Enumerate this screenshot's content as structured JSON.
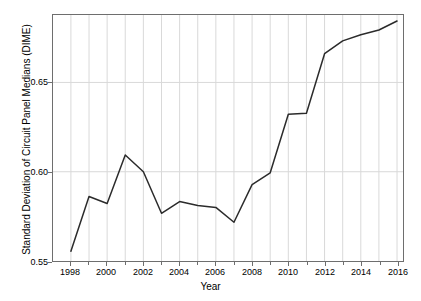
{
  "chart_data": {
    "type": "line",
    "title": "",
    "xlabel": "Year",
    "ylabel": "Standard Deviation of Circuit Panel Medians (DIME)",
    "xlim": [
      1997.0,
      1997.0
    ],
    "ylim": [
      0.55,
      0.6878
    ],
    "xlim_values": [
      1997.0,
      2017.0
    ],
    "grid": true,
    "legend": "none",
    "x": [
      1998,
      1999,
      2000,
      2001,
      2002,
      2003,
      2004,
      2005,
      2006,
      2007,
      2008,
      2009,
      2010,
      2011,
      2012,
      2013,
      2014,
      2015,
      2016
    ],
    "values": [
      0.5555,
      0.5861,
      0.5822,
      0.6094,
      0.6,
      0.5767,
      0.5833,
      0.5811,
      0.58,
      0.5717,
      0.5928,
      0.5994,
      0.6322,
      0.6328,
      0.6661,
      0.6733,
      0.6767,
      0.6794,
      0.6844
    ],
    "series": [
      {
        "name": "Standard Deviation of Circuit Panel Medians (DIME)",
        "color": "#2b2b2b",
        "values": [
          0.5555,
          0.5861,
          0.5822,
          0.6094,
          0.6,
          0.5767,
          0.5833,
          0.5811,
          0.58,
          0.5717,
          0.5928,
          0.5994,
          0.6322,
          0.6328,
          0.6661,
          0.6733,
          0.6767,
          0.6794,
          0.6844
        ]
      }
    ],
    "y_ticks": [
      0.55,
      0.6,
      0.65
    ],
    "y_tick_labels": [
      "0.55",
      "0.60",
      "0.65"
    ],
    "x_ticks": [
      1998,
      2000,
      2002,
      2004,
      2006,
      2008,
      2010,
      2012,
      2014,
      2016
    ],
    "x_tick_labels": [
      "1998",
      "2000",
      "2002",
      "2004",
      "2006",
      "2008",
      "2010",
      "2012",
      "2014",
      "2016"
    ],
    "x_minor_ticks": [
      1999,
      2001,
      2003,
      2005,
      2007,
      2009,
      2011,
      2013,
      2015
    ],
    "colors": {
      "line": "#2b2b2b",
      "grid": "#d9d9d9",
      "axis": "#6e6e6e",
      "background": "#ffffff",
      "text": "#000000"
    }
  }
}
